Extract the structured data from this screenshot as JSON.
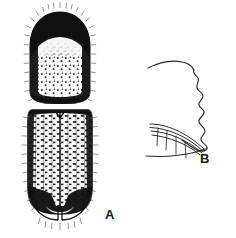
{
  "plate": {
    "background_color": "#fefefe",
    "ink_color": "#111111",
    "width": 236,
    "height": 238,
    "medium": "line-and-stipple scientific illustration"
  },
  "figures": [
    {
      "key": "A",
      "label": "A",
      "label_position": {
        "x": 105,
        "y": 208
      },
      "subject": "bark beetle, dorsal view",
      "parts": [
        {
          "name": "pronotum",
          "texture": "coarse asperate granules above, fine punctures below",
          "outline": "rounded dome"
        },
        {
          "name": "elytra",
          "texture": "longitudinal rows of dash-like strial punctures",
          "outline": "parallel-sided, rounded apex"
        },
        {
          "name": "elytral-declivity",
          "texture": "dark apical band with curved margin"
        },
        {
          "name": "setae-fringe",
          "texture": "fine hair-like bristles along margins"
        }
      ]
    },
    {
      "key": "B",
      "label": "B",
      "label_position": {
        "x": 200,
        "y": 152
      },
      "subject": "elytral declivity, lateral view",
      "parts": [
        {
          "name": "crenulate-margin",
          "texture": "wavy undulating profile line"
        },
        {
          "name": "declivital-face",
          "texture": "converging curved strial lines"
        },
        {
          "name": "interstrial-setae",
          "texture": "four vertical hair lines"
        },
        {
          "name": "ventral-margin",
          "texture": "single sweeping curve"
        }
      ]
    }
  ],
  "labels": {
    "figure_a": "A",
    "figure_b": "B"
  }
}
